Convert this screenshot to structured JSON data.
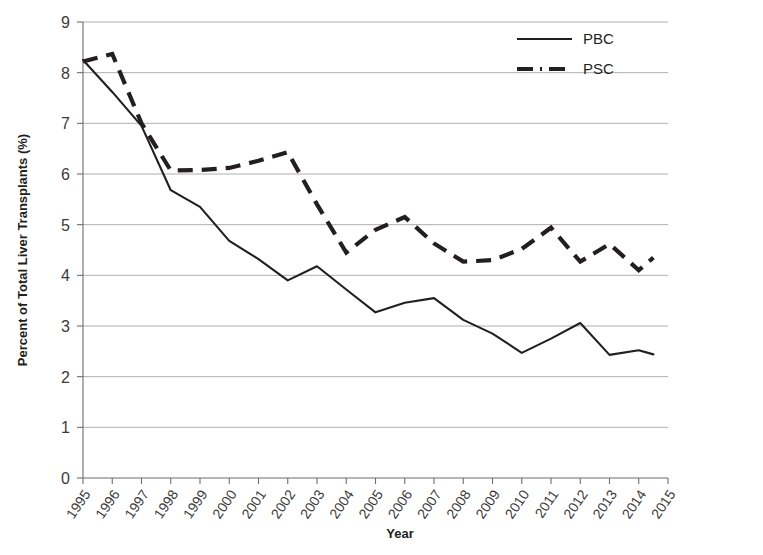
{
  "chart_data": {
    "type": "line",
    "title": "",
    "xlabel": "Year",
    "ylabel": "Percent of Total Liver Transplants (%)",
    "xlim": [
      1995,
      2015
    ],
    "ylim": [
      0,
      9
    ],
    "ytick_step": 1,
    "grid": true,
    "legend_position": "top-right",
    "categories": [
      1995,
      1996,
      1997,
      1998,
      1999,
      2000,
      2001,
      2002,
      2003,
      2004,
      2005,
      2006,
      2007,
      2008,
      2009,
      2010,
      2011,
      2012,
      2013,
      2014,
      2015
    ],
    "tick_labels_x": [
      "1995",
      "1996",
      "1997",
      "1998",
      "1999",
      "2000",
      "2001",
      "2002",
      "2003",
      "2004",
      "2005",
      "2006",
      "2007",
      "2008",
      "2009",
      "2010",
      "2011",
      "2012",
      "2013",
      "2014",
      "2015"
    ],
    "tick_labels_y": [
      "0",
      "1",
      "2",
      "3",
      "4",
      "5",
      "6",
      "7",
      "8",
      "9"
    ],
    "series": [
      {
        "name": "PBC",
        "style": "solid",
        "color": "#231f20",
        "x": [
          1995,
          1996,
          1997,
          1998,
          1999,
          2000,
          2001,
          2002,
          2003,
          2004,
          2005,
          2006,
          2007,
          2008,
          2009,
          2010,
          2011,
          2012,
          2013,
          2014
        ],
        "values": [
          8.25,
          7.62,
          6.95,
          5.68,
          5.35,
          4.68,
          4.32,
          3.9,
          4.18,
          3.72,
          3.27,
          3.46,
          3.55,
          3.12,
          2.85,
          2.47,
          2.75,
          3.06,
          2.43,
          2.52
        ]
      },
      {
        "name": "PSC",
        "style": "dashed",
        "color": "#231f20",
        "x": [
          1995,
          1996,
          1997,
          1998,
          1999,
          2000,
          2001,
          2002,
          2003,
          2004,
          2005,
          2006,
          2007,
          2008,
          2009,
          2010,
          2011,
          2012,
          2013,
          2014
        ],
        "values": [
          8.22,
          8.37,
          7.0,
          6.07,
          6.08,
          6.12,
          6.26,
          6.43,
          5.4,
          4.45,
          4.9,
          5.15,
          4.63,
          4.27,
          4.3,
          4.52,
          4.94,
          4.27,
          4.62,
          4.1
        ]
      }
    ],
    "extra_points": {
      "pbc_last": {
        "x": 2014.5,
        "y": 2.44
      },
      "psc_last": {
        "x": 2014.5,
        "y": 4.35
      }
    }
  },
  "legend": {
    "items": [
      {
        "label": "PBC",
        "style": "solid"
      },
      {
        "label": "PSC",
        "style": "dash-dot"
      }
    ]
  },
  "axes": {
    "x_title": "Year",
    "y_title": "Percent of Total Liver Transplants (%)"
  }
}
